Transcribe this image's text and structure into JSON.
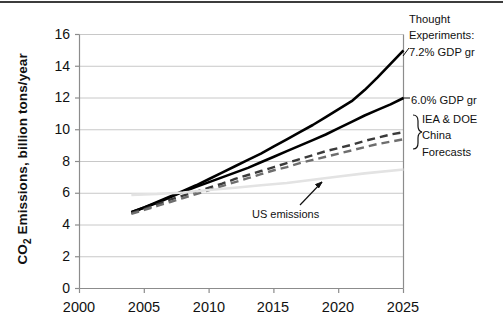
{
  "chart_data": {
    "type": "line",
    "title": "",
    "xlabel": "",
    "ylabel": "CO2 Emissions, billion tons/year",
    "ylabel_prefix": "CO",
    "ylabel_sub": "2",
    "ylabel_suffix": " Emissions, billion tons/year",
    "xlim": [
      2000,
      2025
    ],
    "ylim": [
      0,
      16
    ],
    "xticks": [
      2000,
      2005,
      2010,
      2015,
      2020,
      2025
    ],
    "yticks": [
      0,
      2,
      4,
      6,
      8,
      10,
      12,
      14,
      16
    ],
    "grid": "horizontal",
    "legend_position": "right-annotations",
    "series": [
      {
        "name": "7.2% GDP gr",
        "style": "solid",
        "color": "#000000",
        "width": 2.6,
        "x": [
          2004,
          2005,
          2006,
          2007,
          2008,
          2009,
          2010,
          2011,
          2012,
          2013,
          2014,
          2015,
          2016,
          2017,
          2018,
          2019,
          2020,
          2021,
          2022,
          2023,
          2024,
          2025
        ],
        "y": [
          4.8,
          5.1,
          5.45,
          5.8,
          6.15,
          6.5,
          6.9,
          7.3,
          7.7,
          8.1,
          8.5,
          8.95,
          9.4,
          9.85,
          10.3,
          10.8,
          11.3,
          11.8,
          12.5,
          13.3,
          14.15,
          15.0
        ]
      },
      {
        "name": "6.0% GDP gr",
        "style": "solid",
        "color": "#000000",
        "width": 2.6,
        "x": [
          2004,
          2005,
          2006,
          2007,
          2008,
          2009,
          2010,
          2011,
          2012,
          2013,
          2014,
          2015,
          2016,
          2017,
          2018,
          2019,
          2020,
          2021,
          2022,
          2023,
          2024,
          2025
        ],
        "y": [
          4.8,
          5.1,
          5.4,
          5.75,
          6.1,
          6.4,
          6.7,
          7.0,
          7.3,
          7.6,
          7.95,
          8.3,
          8.65,
          9.0,
          9.35,
          9.7,
          10.1,
          10.5,
          10.9,
          11.25,
          11.6,
          12.0
        ]
      },
      {
        "name": "IEA China Forecast",
        "style": "dashed",
        "color": "#3a3a3a",
        "width": 2.4,
        "x": [
          2004,
          2005,
          2006,
          2007,
          2008,
          2009,
          2010,
          2011,
          2012,
          2013,
          2014,
          2015,
          2016,
          2017,
          2018,
          2019,
          2020,
          2021,
          2022,
          2023,
          2024,
          2025
        ],
        "y": [
          4.75,
          5.0,
          5.3,
          5.6,
          5.85,
          6.1,
          6.35,
          6.6,
          6.9,
          7.15,
          7.4,
          7.65,
          7.9,
          8.15,
          8.4,
          8.65,
          8.85,
          9.05,
          9.3,
          9.5,
          9.7,
          9.85
        ]
      },
      {
        "name": "DOE China Forecast",
        "style": "dashed",
        "color": "#6e6e6e",
        "width": 2.4,
        "x": [
          2004,
          2005,
          2006,
          2007,
          2008,
          2009,
          2010,
          2011,
          2012,
          2013,
          2014,
          2015,
          2016,
          2017,
          2018,
          2019,
          2020,
          2021,
          2022,
          2023,
          2024,
          2025
        ],
        "y": [
          4.7,
          4.95,
          5.2,
          5.45,
          5.7,
          5.95,
          6.2,
          6.45,
          6.7,
          6.95,
          7.2,
          7.45,
          7.65,
          7.9,
          8.1,
          8.3,
          8.5,
          8.7,
          8.9,
          9.1,
          9.25,
          9.4
        ]
      },
      {
        "name": "US emissions",
        "style": "solid",
        "color": "#e3e3e3",
        "width": 2.6,
        "x": [
          2004,
          2006,
          2008,
          2010,
          2012,
          2014,
          2016,
          2018,
          2020,
          2022,
          2025
        ],
        "y": [
          5.9,
          5.95,
          6.05,
          6.2,
          6.35,
          6.5,
          6.65,
          6.85,
          7.05,
          7.25,
          7.5
        ]
      }
    ],
    "annotations": [
      {
        "id": "thought-experiments",
        "text_lines": [
          "Thought",
          "Experiments:",
          "7.2% GDP gr"
        ]
      },
      {
        "id": "gdp-6",
        "text_lines": [
          "6.0% GDP gr"
        ]
      },
      {
        "id": "iea-doe",
        "text_lines": [
          "IEA & DOE",
          "China",
          "Forecasts"
        ]
      },
      {
        "id": "us-emissions",
        "text_lines": [
          "US emissions"
        ]
      }
    ]
  },
  "annotations": {
    "thought_line1": "Thought",
    "thought_line2": "Experiments:",
    "thought_line3": "7.2% GDP gr",
    "gdp6": "6.0% GDP gr",
    "iea_line1": "IEA & DOE",
    "iea_line2": "China",
    "iea_line3": "Forecasts",
    "us_emissions": "US emissions"
  },
  "axes": {
    "ylabel_prefix": "CO",
    "ylabel_sub": "2",
    "ylabel_suffix": " Emissions, billion tons/year",
    "y": {
      "t0": "0",
      "t1": "2",
      "t2": "4",
      "t3": "6",
      "t4": "8",
      "t5": "10",
      "t6": "12",
      "t7": "14",
      "t8": "16"
    },
    "x": {
      "t0": "2000",
      "t1": "2005",
      "t2": "2010",
      "t3": "2015",
      "t4": "2020",
      "t5": "2025"
    }
  },
  "colors": {
    "line_black": "#000000",
    "dash_dark": "#3a3a3a",
    "dash_gray": "#6e6e6e",
    "us_gray": "#e3e3e3",
    "grid": "#c8c8c8",
    "axis": "#8c8c8c",
    "border": "#3c3c3c"
  }
}
